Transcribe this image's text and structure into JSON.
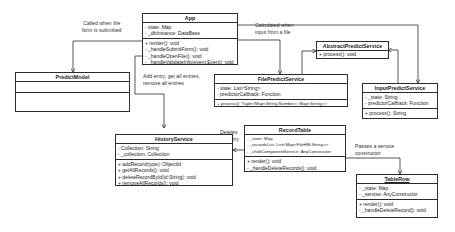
{
  "diagram": {
    "type": "uml-class-diagram",
    "classes": {
      "app": {
        "name": "App",
        "attributes": [
          "- state: Map",
          "- _dbInstance: DataBase"
        ],
        "methods": [
          "+ render(): void",
          "- _handleSubmitForm(): void",
          "- _handleOpenFile(): void",
          "- _handleValidateInfo(event:Event): void"
        ]
      },
      "predict_model": {
        "name": "PredictModel",
        "attributes": [],
        "methods": []
      },
      "abstract_predict_service": {
        "name": "AbstractPredictService",
        "attributes": [],
        "methods": [
          "+ process(): void"
        ]
      },
      "file_predict_service": {
        "name": "FilePredictService",
        "attributes": [
          "- state: List<String>",
          "- predictorCallback: Function"
        ],
        "methods": [
          "+ process(): Tuple<Map<String,Number>, Map<String>>"
        ]
      },
      "input_predict_service": {
        "name": "InputPredictService",
        "attributes": [
          "- _state: String",
          "- predictorCallback: Function"
        ],
        "methods": [
          "+ process(): String"
        ]
      },
      "history_service": {
        "name": "HistoryService",
        "attributes": [
          "- Collection: String",
          "- _collection: Collection"
        ],
        "methods": [
          "+ addRecord(type): ObjectId",
          "+ getAllRecords(): void",
          "+ deleteRecordById(id:String): void",
          "+ removeAllRecords(): void"
        ]
      },
      "record_table": {
        "name": "RecordTable",
        "attributes": [
          "- _state: Map",
          "- _recordsList: List<Map<FileHM,String>>",
          "- _childComponentService: AnyConstructor"
        ],
        "methods": [
          "+ render(): void",
          "- _handleDeleteRecords(): void"
        ]
      },
      "table_row": {
        "name": "TableRow",
        "attributes": [
          "- _state: Map",
          "- _servise: AnyConstructor"
        ],
        "methods": [
          "+ render(): void",
          "- _handleDeleteRecord(): void"
        ]
      }
    },
    "notes": {
      "submit": [
        "Called when the",
        "form is submitted"
      ],
      "file_input": [
        "Calculated when",
        "input from a file"
      ],
      "history": [
        "Add entry, get all entries,",
        "remove all entries"
      ],
      "delete": [
        "Deletes",
        "an entry"
      ],
      "service": [
        "Passes a service",
        "constructor"
      ]
    },
    "colors": {
      "line": "#2b2b2b",
      "background": "#ffffff"
    }
  }
}
